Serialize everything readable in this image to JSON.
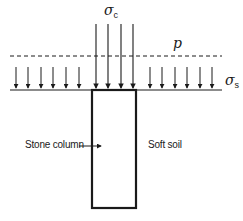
{
  "diagram": {
    "title": "",
    "labels": {
      "sigma_c": {
        "symbol": "σ",
        "subscript": "c"
      },
      "sigma_s": {
        "symbol": "σ",
        "subscript": "s"
      },
      "p": "p",
      "stone_column": "Stone column",
      "soft_soil": "Soft soil"
    },
    "colors": {
      "stroke": "#1a1a1a",
      "background": "#ffffff"
    },
    "elements": {
      "ground_line": {
        "x1": 10,
        "x2": 222,
        "y": 90
      },
      "dashed_line": {
        "x1": 10,
        "x2": 222,
        "y": 56,
        "label": "p"
      },
      "column": {
        "x": 92,
        "y": 90,
        "width": 44,
        "height": 118,
        "label": "Stone column"
      },
      "column_arrows": {
        "count": 4,
        "xs": [
          96,
          108,
          121,
          133
        ],
        "y_top": 24,
        "y_bottom": 89,
        "label": "σc"
      },
      "soil_arrows_left": {
        "count": 6,
        "xs": [
          16,
          28,
          41,
          53,
          66,
          79
        ],
        "y_top": 67,
        "y_bottom": 89
      },
      "soil_arrows_right": {
        "count": 6,
        "xs": [
          150,
          162,
          175,
          187,
          200,
          212
        ],
        "y_top": 67,
        "y_bottom": 89,
        "label": "σs"
      },
      "pointer_arrow": {
        "from_x": 80,
        "to_x": 102,
        "y": 146
      }
    }
  }
}
